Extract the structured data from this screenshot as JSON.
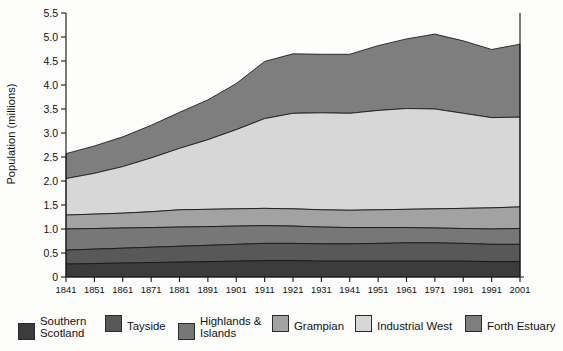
{
  "chart_data": {
    "type": "area",
    "title": "",
    "xlabel": "",
    "ylabel": "Population (millions)",
    "stacked": true,
    "grid": false,
    "legend_position": "bottom",
    "ylim": [
      0,
      5.5
    ],
    "ytick_labels": [
      "0",
      "0.5",
      "1.0",
      "1.5",
      "2.0",
      "2.5",
      "3.0",
      "3.5",
      "4.0",
      "4.5",
      "5.0",
      "5.5"
    ],
    "ytick_values": [
      0,
      0.5,
      1.0,
      1.5,
      2.0,
      2.5,
      3.0,
      3.5,
      4.0,
      4.5,
      5.0,
      5.5
    ],
    "categories": [
      "1841",
      "1851",
      "1861",
      "1871",
      "1881",
      "1891",
      "1901",
      "1911",
      "1921",
      "1931",
      "1941",
      "1951",
      "1961",
      "1971",
      "1981",
      "1991",
      "2001"
    ],
    "x": [
      1841,
      1851,
      1861,
      1871,
      1881,
      1891,
      1901,
      1911,
      1921,
      1931,
      1941,
      1951,
      1961,
      1971,
      1981,
      1991,
      2001
    ],
    "series": [
      {
        "name": "Southern Scotland",
        "color": "#3c3c3c",
        "values": [
          0.27,
          0.28,
          0.29,
          0.3,
          0.31,
          0.32,
          0.33,
          0.34,
          0.34,
          0.33,
          0.33,
          0.33,
          0.33,
          0.33,
          0.33,
          0.32,
          0.32
        ]
      },
      {
        "name": "Tayside",
        "color": "#585858",
        "values": [
          0.29,
          0.3,
          0.31,
          0.32,
          0.33,
          0.34,
          0.35,
          0.36,
          0.36,
          0.36,
          0.36,
          0.37,
          0.38,
          0.38,
          0.37,
          0.36,
          0.36
        ]
      },
      {
        "name": "Highlands & Islands",
        "color": "#777777",
        "values": [
          0.44,
          0.43,
          0.42,
          0.41,
          0.4,
          0.39,
          0.38,
          0.37,
          0.36,
          0.35,
          0.34,
          0.33,
          0.32,
          0.31,
          0.31,
          0.32,
          0.33
        ]
      },
      {
        "name": "Grampian",
        "color": "#a2a2a2",
        "values": [
          0.29,
          0.3,
          0.31,
          0.33,
          0.36,
          0.36,
          0.36,
          0.36,
          0.36,
          0.36,
          0.36,
          0.37,
          0.38,
          0.4,
          0.42,
          0.44,
          0.45
        ]
      },
      {
        "name": "Industrial West",
        "color": "#d7d7d7",
        "values": [
          0.76,
          0.85,
          0.97,
          1.12,
          1.28,
          1.45,
          1.65,
          1.87,
          1.99,
          2.02,
          2.02,
          2.07,
          2.1,
          2.08,
          1.98,
          1.88,
          1.87
        ]
      },
      {
        "name": "Forth Estuary",
        "color": "#7e7e7e",
        "values": [
          0.52,
          0.57,
          0.62,
          0.68,
          0.75,
          0.83,
          0.96,
          1.19,
          1.24,
          1.22,
          1.23,
          1.35,
          1.45,
          1.56,
          1.51,
          1.42,
          1.52
        ]
      }
    ],
    "totals": [
      2.57,
      2.73,
      2.92,
      3.16,
      3.43,
      3.69,
      4.03,
      4.49,
      4.65,
      4.64,
      4.64,
      4.82,
      4.96,
      5.06,
      4.92,
      4.74,
      4.85
    ],
    "annotations": []
  },
  "legend": {
    "entries": [
      {
        "label": "Southern\nScotland",
        "color": "#3c3c3c"
      },
      {
        "label": "Tayside",
        "color": "#585858"
      },
      {
        "label": "Highlands &\nIslands",
        "color": "#777777"
      },
      {
        "label": "Grampian",
        "color": "#a2a2a2"
      },
      {
        "label": "Industrial West",
        "color": "#d7d7d7"
      },
      {
        "label": "Forth Estuary",
        "color": "#7e7e7e"
      }
    ]
  }
}
